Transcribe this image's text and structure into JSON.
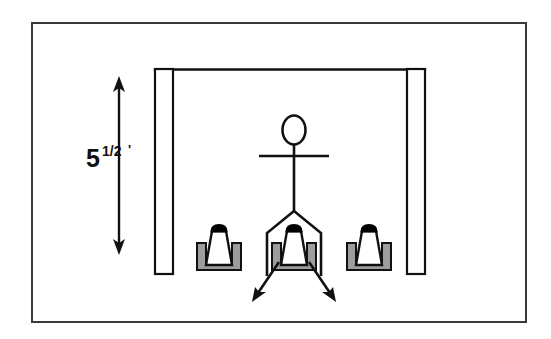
{
  "figure": {
    "border": {
      "x": 31,
      "y": 22,
      "width": 496,
      "height": 301,
      "stroke": "#3a3a3a",
      "stroke_width": 2,
      "fill": "#ffffff"
    },
    "colors": {
      "line": "#111111",
      "fill_white": "#ffffff",
      "fill_gray": "#9d9d9d",
      "fill_black": "#000000",
      "border": "#3a3a3a",
      "background": "#ffffff"
    }
  },
  "dimension": {
    "label_value": "5",
    "label_superscript": "1/2",
    "label_prime": "'",
    "full_label": "5 1/2'",
    "meaning": "five and one half feet",
    "line": {
      "x": 119,
      "y_top": 80,
      "y_bottom": 251,
      "stroke_width": 2,
      "arrowheads": "both"
    },
    "text_position": {
      "x": 88,
      "y": 160
    }
  },
  "structure": {
    "name": "doorway-opening",
    "top_beam": {
      "x1": 155,
      "y1": 69,
      "x2": 425,
      "y2": 69,
      "stroke_width": 2
    },
    "left_wall": {
      "x": 155,
      "y": 69,
      "width": 18,
      "height": 205
    },
    "right_wall": {
      "x": 407,
      "y": 69,
      "width": 18,
      "height": 205
    }
  },
  "person": {
    "name": "stick-figure",
    "head": {
      "cx": 294,
      "cy": 130,
      "rx": 11,
      "ry": 14
    },
    "neck": {
      "x": 294,
      "y1": 144,
      "y2": 155
    },
    "arms": {
      "x1": 260,
      "x2": 328,
      "y": 156
    },
    "spine": {
      "x": 294,
      "y1": 155,
      "y2": 211
    },
    "leg_left": [
      [
        294,
        211
      ],
      [
        268,
        233
      ],
      [
        268,
        275
      ]
    ],
    "leg_right": [
      [
        294,
        211
      ],
      [
        320,
        233
      ],
      [
        320,
        275
      ]
    ]
  },
  "seats": [
    {
      "name": "seat-left",
      "id": "left",
      "cx": 219,
      "base_y": 268,
      "width": 44,
      "height": 44
    },
    {
      "name": "seat-center",
      "id": "center",
      "cx": 294,
      "base_y": 268,
      "width": 44,
      "height": 44
    },
    {
      "name": "seat-right",
      "id": "right",
      "cx": 369,
      "base_y": 268,
      "width": 44,
      "height": 44
    }
  ],
  "arrows": [
    {
      "name": "arrow-down-left",
      "from": [
        277,
        262
      ],
      "to": [
        253,
        299
      ],
      "direction": "down-left"
    },
    {
      "name": "arrow-down-right",
      "from": [
        311,
        262
      ],
      "to": [
        335,
        299
      ],
      "direction": "down-right"
    }
  ]
}
